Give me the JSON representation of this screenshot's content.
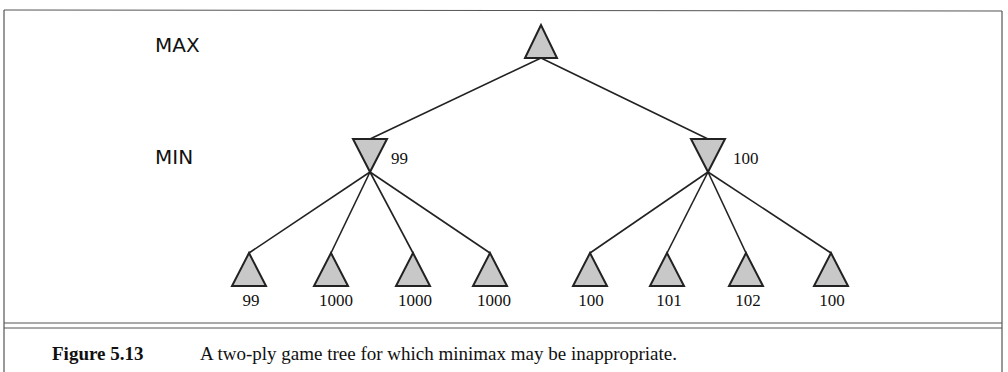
{
  "diagram": {
    "type": "game-tree",
    "levels": {
      "max_label": "MAX",
      "min_label": "MIN"
    },
    "root": {
      "kind": "max",
      "value": ""
    },
    "min_nodes": [
      {
        "kind": "min",
        "value": "99"
      },
      {
        "kind": "min",
        "value": "100"
      }
    ],
    "leaves": [
      {
        "parent": 0,
        "value": "99"
      },
      {
        "parent": 0,
        "value": "1000"
      },
      {
        "parent": 0,
        "value": "1000"
      },
      {
        "parent": 0,
        "value": "1000"
      },
      {
        "parent": 1,
        "value": "100"
      },
      {
        "parent": 1,
        "value": "101"
      },
      {
        "parent": 1,
        "value": "102"
      },
      {
        "parent": 1,
        "value": "100"
      }
    ],
    "node_fill": "#c8c8c8",
    "stroke_color": "#222222"
  },
  "caption": {
    "label": "Figure 5.13",
    "text": "A two-ply game tree for which minimax may be inappropriate."
  }
}
